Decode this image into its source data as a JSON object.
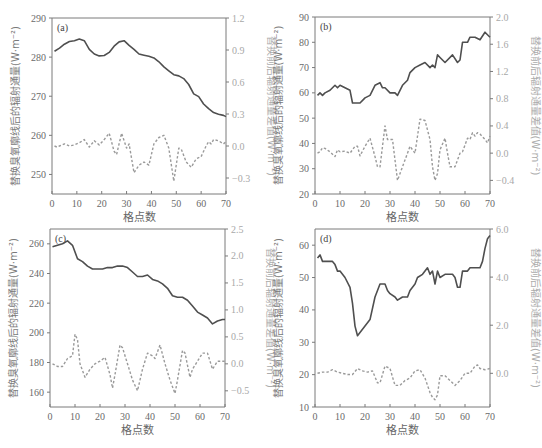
{
  "chart_data": [
    {
      "panel": "(a)",
      "type": "line",
      "xlabel": "格点数",
      "ylabel": "替换臭氧廓线后的辐射通量(W·m⁻²)",
      "ylabel_right": "替换前后辐射通量差值(W·m⁻²)",
      "xlim": [
        0,
        70
      ],
      "xticks": [
        0,
        10,
        20,
        30,
        40,
        50,
        60,
        70
      ],
      "ylim": [
        245,
        290
      ],
      "yticks": [
        250,
        260,
        270,
        280,
        290
      ],
      "ylim_right": [
        -0.45,
        1.2
      ],
      "yticks_right": [
        -0.3,
        0.0,
        0.3,
        0.6,
        0.9,
        1.2
      ],
      "series": [
        {
          "name": "替换臭氧廓线后的辐射通量",
          "axis": "left",
          "style": "solid",
          "x": [
            1,
            3,
            5,
            7,
            9,
            11,
            13,
            15,
            17,
            19,
            21,
            23,
            25,
            27,
            29,
            31,
            33,
            35,
            37,
            39,
            41,
            43,
            45,
            47,
            49,
            51,
            53,
            55,
            57,
            59,
            61,
            63,
            65,
            67,
            69,
            70
          ],
          "values": [
            281.5,
            282.3,
            283.3,
            284.0,
            284.2,
            284.6,
            284.2,
            282.0,
            280.8,
            280.3,
            280.4,
            281.2,
            282.8,
            283.9,
            284.2,
            283.0,
            282.0,
            280.8,
            280.5,
            280.2,
            279.8,
            278.8,
            277.5,
            276.5,
            275.5,
            275.2,
            274.5,
            273.0,
            270.6,
            269.9,
            268.0,
            266.8,
            265.8,
            265.4,
            265.1,
            264.8
          ]
        },
        {
          "name": "替换前后辐射通量差值",
          "axis": "right",
          "style": "dashed",
          "x": [
            1,
            2,
            3,
            5,
            7,
            9,
            11,
            13,
            15,
            17,
            19,
            21,
            23,
            25,
            26,
            28,
            30,
            31,
            33,
            35,
            37,
            39,
            41,
            43,
            45,
            47,
            49,
            51,
            52,
            54,
            56,
            58,
            60,
            62,
            63,
            64,
            65,
            67,
            69,
            70
          ],
          "values": [
            0.0,
            -0.01,
            0.0,
            0.02,
            0.0,
            0.01,
            0.03,
            0.06,
            -0.01,
            0.05,
            0.01,
            0.06,
            0.12,
            -0.05,
            -0.08,
            0.12,
            -0.02,
            0.02,
            -0.25,
            -0.18,
            -0.15,
            -0.18,
            0.02,
            0.08,
            0.1,
            -0.02,
            -0.33,
            -0.02,
            -0.03,
            -0.15,
            -0.2,
            -0.12,
            -0.1,
            0.0,
            0.04,
            0.02,
            0.06,
            0.05,
            0.02,
            0.04
          ]
        }
      ]
    },
    {
      "panel": "(b)",
      "type": "line",
      "xlabel": "格点数",
      "ylabel": "替换臭氧廓线后的辐射通量(W·m⁻²)",
      "ylabel_right": "替换前后辐射通量差值(W·m⁻²)",
      "xlim": [
        0,
        70
      ],
      "xticks": [
        0,
        10,
        20,
        30,
        40,
        50,
        60,
        70
      ],
      "ylim": [
        20,
        90
      ],
      "yticks": [
        20,
        30,
        40,
        50,
        60,
        70,
        80,
        90
      ],
      "ylim_right": [
        -0.6,
        2.0
      ],
      "yticks_right": [
        -0.4,
        0.0,
        0.4,
        0.8,
        1.2,
        1.6,
        2.0
      ],
      "series": [
        {
          "name": "替换臭氧廓线后的辐射通量",
          "axis": "left",
          "style": "solid",
          "x": [
            1,
            2,
            3,
            4,
            6,
            8,
            9,
            10,
            12,
            14,
            15,
            16,
            18,
            20,
            22,
            24,
            26,
            27,
            28,
            30,
            32,
            33,
            35,
            37,
            38,
            40,
            42,
            44,
            46,
            47,
            48,
            49,
            50,
            52,
            55,
            57,
            58,
            59,
            61,
            62,
            64,
            66,
            68,
            70
          ],
          "values": [
            59,
            60,
            59,
            60,
            61,
            63,
            62,
            63,
            62,
            61,
            56,
            56,
            56,
            58,
            59,
            63,
            64,
            62,
            62,
            60,
            60,
            59,
            63,
            65,
            68,
            70,
            71,
            72,
            70,
            71,
            70,
            75,
            74,
            72,
            75,
            72,
            73,
            80,
            80,
            82,
            82,
            81,
            84,
            82
          ]
        },
        {
          "name": "替换前后辐射通量差值",
          "axis": "right",
          "style": "dashed",
          "x": [
            1,
            2,
            3,
            4,
            6,
            8,
            9,
            10,
            12,
            14,
            16,
            17,
            18,
            20,
            22,
            24,
            25,
            26,
            28,
            29,
            31,
            33,
            35,
            37,
            38,
            40,
            42,
            44,
            46,
            47,
            48,
            49,
            50,
            52,
            53,
            54,
            56,
            58,
            59,
            61,
            62,
            63,
            64,
            65,
            66,
            68,
            69,
            70
          ],
          "values": [
            0.0,
            0.02,
            0.08,
            0.07,
            0.02,
            -0.05,
            0.05,
            0.02,
            0.03,
            0.0,
            0.1,
            0.1,
            -0.04,
            0.1,
            0.22,
            -0.05,
            -0.2,
            -0.2,
            0.4,
            0.2,
            0.2,
            -0.4,
            -0.2,
            0.0,
            0.1,
            0.0,
            0.5,
            0.48,
            0.2,
            -0.2,
            -0.4,
            -0.3,
            0.05,
            0.22,
            0.0,
            -0.2,
            -0.2,
            0.0,
            0.02,
            0.22,
            0.2,
            0.3,
            0.25,
            0.3,
            0.28,
            0.2,
            0.15,
            0.25
          ]
        }
      ]
    },
    {
      "panel": "(c)",
      "type": "line",
      "xlabel": "格点数",
      "ylabel": "替换臭氧廓线后的辐射通量(W·m⁻²)",
      "ylabel_right": "替换前后辐射通量差值(W·m⁻²)",
      "xlim": [
        0,
        70
      ],
      "xticks": [
        0,
        10,
        20,
        30,
        40,
        50,
        60,
        70
      ],
      "ylim": [
        150,
        270
      ],
      "yticks": [
        160,
        180,
        200,
        220,
        240,
        260
      ],
      "ylim_right": [
        -0.8,
        2.5
      ],
      "yticks_right": [
        -0.5,
        0.0,
        0.5,
        1.0,
        1.5,
        2.0,
        2.5
      ],
      "series": [
        {
          "name": "替换臭氧廓线后的辐射通量",
          "axis": "left",
          "style": "solid",
          "x": [
            1,
            3,
            5,
            7,
            9,
            11,
            13,
            15,
            17,
            19,
            21,
            23,
            25,
            27,
            29,
            31,
            33,
            35,
            37,
            39,
            41,
            43,
            45,
            47,
            49,
            51,
            53,
            55,
            57,
            59,
            61,
            63,
            65,
            67,
            69,
            70
          ],
          "values": [
            258,
            259,
            260,
            262,
            259,
            250,
            248,
            245,
            243,
            243,
            243,
            244,
            244,
            245,
            245,
            244,
            241,
            238,
            238,
            239,
            236,
            235,
            233,
            230,
            225,
            224,
            224,
            222,
            218,
            214,
            212,
            210,
            206,
            208,
            209,
            209
          ]
        },
        {
          "name": "替换前后辐射通量差值",
          "axis": "right",
          "style": "dashed",
          "x": [
            1,
            3,
            5,
            7,
            9,
            10,
            11,
            12,
            14,
            16,
            18,
            20,
            22,
            24,
            25,
            26,
            28,
            29,
            31,
            33,
            35,
            37,
            39,
            41,
            42,
            44,
            46,
            48,
            50,
            51,
            53,
            54,
            56,
            57,
            59,
            61,
            63,
            65,
            67,
            69,
            70
          ],
          "values": [
            0.0,
            -0.05,
            -0.05,
            0.1,
            0.15,
            0.55,
            0.45,
            0.0,
            -0.25,
            -0.1,
            0.0,
            0.05,
            0.12,
            -0.2,
            -0.45,
            -0.2,
            0.35,
            0.3,
            0.0,
            -0.3,
            -0.5,
            -0.1,
            0.2,
            0.15,
            0.1,
            0.35,
            0.0,
            -0.3,
            -0.55,
            -0.3,
            0.25,
            0.2,
            -0.25,
            -0.1,
            0.05,
            0.2,
            0.2,
            -0.1,
            0.05,
            0.05,
            0.05
          ]
        }
      ]
    },
    {
      "panel": "(d)",
      "type": "line",
      "xlabel": "格点数",
      "ylabel": "替换臭氧廓线后的辐射通量(W·m⁻²)",
      "ylabel_right": "替换前后辐射通量差值(W·m⁻²)",
      "xlim": [
        0,
        70
      ],
      "xticks": [
        0,
        10,
        20,
        30,
        40,
        50,
        60,
        70
      ],
      "ylim": [
        10,
        65
      ],
      "yticks": [
        10,
        20,
        30,
        40,
        50,
        60
      ],
      "ylim_right": [
        -1.4,
        6.0
      ],
      "yticks_right": [
        0.0,
        2.0,
        4.0,
        6.0
      ],
      "series": [
        {
          "name": "替换臭氧廓线后的辐射通量",
          "axis": "left",
          "style": "solid",
          "x": [
            1,
            2,
            3,
            5,
            7,
            8,
            9,
            10,
            11,
            12,
            14,
            15,
            16,
            17,
            18,
            20,
            22,
            24,
            26,
            27,
            28,
            29,
            30,
            32,
            33,
            35,
            37,
            38,
            40,
            41,
            43,
            45,
            46,
            47,
            48,
            49,
            50,
            52,
            54,
            55,
            56,
            57,
            58,
            59,
            61,
            62,
            64,
            66,
            67,
            68,
            69,
            70
          ],
          "values": [
            56,
            57,
            55,
            55,
            55,
            54,
            52,
            52,
            51,
            50,
            47,
            42,
            35,
            32,
            33,
            35,
            37,
            44,
            48,
            48,
            48,
            46,
            45,
            44,
            43,
            44,
            44,
            46,
            48,
            50,
            51,
            53,
            51,
            52,
            48,
            52,
            50,
            51,
            51,
            51,
            50,
            47,
            47,
            52,
            52,
            53,
            53,
            53,
            55,
            59,
            62,
            63
          ]
        },
        {
          "name": "替换前后辐射通量差值",
          "axis": "right",
          "style": "dashed",
          "x": [
            1,
            3,
            5,
            7,
            9,
            11,
            13,
            15,
            17,
            19,
            21,
            23,
            25,
            26,
            28,
            30,
            32,
            34,
            36,
            38,
            40,
            42,
            44,
            46,
            47,
            48,
            49,
            50,
            52,
            54,
            56,
            58,
            60,
            62,
            64,
            65,
            66,
            68,
            70
          ],
          "values": [
            0.0,
            0.05,
            0.05,
            0.15,
            0.05,
            0.0,
            -0.05,
            -0.05,
            0.2,
            0.1,
            0.05,
            0.1,
            -0.4,
            -0.4,
            0.3,
            0.2,
            -0.5,
            -0.5,
            -0.3,
            -0.2,
            0.1,
            0.15,
            -0.2,
            -0.8,
            -1.0,
            -1.1,
            -0.9,
            -0.1,
            -0.1,
            -0.3,
            -0.5,
            -0.3,
            0.0,
            0.0,
            0.3,
            0.35,
            0.2,
            0.15,
            0.2
          ]
        }
      ]
    }
  ],
  "panels": {
    "a": {
      "label": "(a)"
    },
    "b": {
      "label": "(b)"
    },
    "c": {
      "label": "(c)"
    },
    "d": {
      "label": "(d)"
    }
  },
  "colors": {
    "solid_line": "#4f4f4f",
    "dashed_line": "#9a9a9a",
    "axis": "#7a7a7a",
    "tick_left": "#6a6a6a",
    "tick_right": "#a8a8a8"
  }
}
